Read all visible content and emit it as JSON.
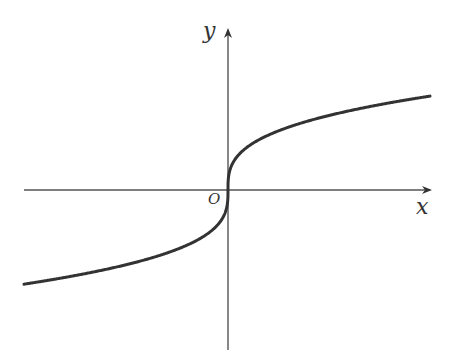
{
  "diagram": {
    "title": "",
    "function": "y = cbrt(x)",
    "labels": {
      "y_axis": "y",
      "x_axis": "x",
      "origin": "O"
    },
    "colors": {
      "axis": "#555555",
      "curve": "#333333",
      "background": "#ffffff"
    },
    "origin_px": [
      228,
      190
    ],
    "x_axis_px": {
      "start": 24,
      "end": 430
    },
    "y_axis_px": {
      "top": 30,
      "bottom": 350
    },
    "curve": {
      "type": "cube-root",
      "x_range_px": [
        24,
        430
      ],
      "scale_k": 16
    }
  }
}
